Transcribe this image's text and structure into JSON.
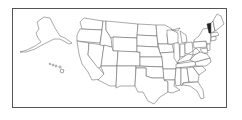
{
  "map": {
    "title": "United States locator map",
    "highlighted_state": "Vermont",
    "highlight_color": "#222222",
    "state_fill": "#ffffff",
    "border_color": "#555555",
    "insets": [
      "Alaska",
      "Hawaii"
    ]
  }
}
